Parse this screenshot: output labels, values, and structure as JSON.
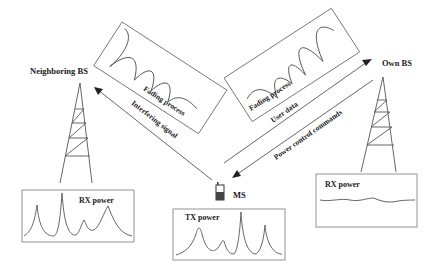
{
  "diagram": {
    "type": "cellular-power-control",
    "nodes": {
      "neighbor_bs": {
        "label": "Neighboring BS"
      },
      "own_bs": {
        "label": "Own BS"
      },
      "ms": {
        "label": "MS"
      }
    },
    "links": {
      "interfering": {
        "label": "Interfering signal",
        "direction": "MS -> Neighboring BS"
      },
      "user_data": {
        "label": "User data",
        "direction": "MS -> Own BS"
      },
      "power_control": {
        "label": "Power control commands",
        "direction": "Own BS -> MS"
      }
    },
    "fading_boxes": {
      "left": {
        "label": "Fading process"
      },
      "right": {
        "label": "Fading process"
      }
    },
    "power_boxes": {
      "neighbor_rx": {
        "label": "RX power",
        "shape": "peaky"
      },
      "ms_tx": {
        "label": "TX power",
        "shape": "peaky"
      },
      "own_rx": {
        "label": "RX power",
        "shape": "flat"
      }
    }
  },
  "colors": {
    "line": "#555555",
    "text": "#222222",
    "box_border": "#888888"
  }
}
